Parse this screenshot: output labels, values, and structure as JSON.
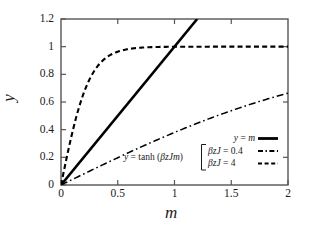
{
  "chart_data": {
    "type": "line",
    "title": "",
    "xlabel": "m",
    "ylabel": "y",
    "xlim": [
      0,
      2
    ],
    "ylim": [
      0,
      1.2
    ],
    "xticks": [
      "0",
      "0.5",
      "1",
      "1.5",
      "2"
    ],
    "xtick_values": [
      0,
      0.5,
      1,
      1.5,
      2
    ],
    "yticks": [
      "0",
      "0.2",
      "0.4",
      "0.6",
      "0.8",
      "1",
      "1.2"
    ],
    "ytick_values": [
      0,
      0.2,
      0.4,
      0.6,
      0.8,
      1,
      1.2
    ],
    "grid": false,
    "legend_position": "lower-right-inside",
    "series": [
      {
        "name": "y = m",
        "style": "solid",
        "color": "#000000",
        "x": [
          0,
          0.2,
          0.4,
          0.6,
          0.8,
          1.0,
          1.2
        ],
        "values": [
          0,
          0.2,
          0.4,
          0.6,
          0.8,
          1.0,
          1.2
        ]
      },
      {
        "name": "betazJ = 0.4",
        "style": "dash-dot",
        "color": "#000000",
        "x": [
          0,
          0.2,
          0.4,
          0.6,
          0.8,
          1.0,
          1.2,
          1.4,
          1.6,
          1.8,
          2.0
        ],
        "values": [
          0,
          0.0798,
          0.1586,
          0.2355,
          0.3095,
          0.3799,
          0.4462,
          0.5079,
          0.5649,
          0.6169,
          0.664
        ]
      },
      {
        "name": "betazJ = 4",
        "style": "dashed",
        "color": "#000000",
        "x": [
          0,
          0.1,
          0.2,
          0.3,
          0.4,
          0.5,
          0.6,
          0.8,
          1.0,
          1.25,
          1.5,
          1.75,
          2.0
        ],
        "values": [
          0,
          0.3799,
          0.664,
          0.8337,
          0.9217,
          0.964,
          0.9836,
          0.9967,
          0.9993,
          0.9999,
          1.0,
          1.0,
          1.0
        ]
      }
    ],
    "annotations": [
      {
        "name": "tanh-curve-label",
        "text": "y = tanh (βzJm)",
        "x": 0.78,
        "y": 0.23
      }
    ]
  },
  "axes": {
    "ylabel": "y",
    "xlabel": "m",
    "yticks": [
      "1.2",
      "1",
      "0.8",
      "0.6",
      "0.4",
      "0.2",
      "0"
    ],
    "xticks": [
      "0",
      "0.5",
      "1",
      "1.5",
      "2"
    ]
  },
  "annotation": {
    "tanh_label_y": "y",
    "tanh_label_eq": " = tanh (",
    "tanh_label_args": "βzJm",
    "tanh_label_close": ")"
  },
  "legend": {
    "entries": [
      {
        "label_y": "y",
        "label_eq": " = ",
        "label_rhs": "m",
        "style": "solid"
      },
      {
        "label_lhs": "βzJ",
        "label_eq": " = ",
        "label_rhs": "0.4",
        "style": "dash-dot"
      },
      {
        "label_lhs": "βzJ",
        "label_eq": " = ",
        "label_rhs": "4",
        "style": "dashed"
      }
    ]
  },
  "colors": {
    "line": "#000000",
    "frame": "#555555",
    "background": "#ffffff",
    "text": "#1a1a1a"
  }
}
